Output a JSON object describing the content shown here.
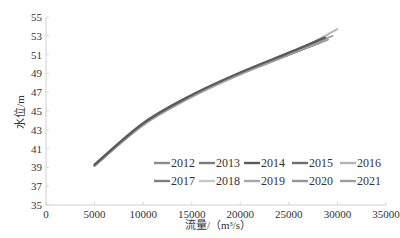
{
  "chart_data": {
    "type": "line",
    "title": "",
    "xlabel": "流量/（m³/s）",
    "ylabel": "水位/m",
    "xlim": [
      0,
      35000
    ],
    "ylim": [
      35,
      55
    ],
    "x_ticks": [
      "0",
      "5000",
      "10000",
      "15000",
      "20000",
      "25000",
      "30000",
      "35000"
    ],
    "y_ticks": [
      "35",
      "37",
      "39",
      "41",
      "43",
      "45",
      "47",
      "49",
      "51",
      "53",
      "55"
    ],
    "grid": false,
    "legend_position": "lower right, inside plot, 2 rows x 5 columns",
    "series": [
      {
        "name": "2012",
        "color": "#8c8c8c",
        "x": [
          5000,
          10000,
          15000,
          20000,
          25000,
          28500
        ],
        "y": [
          39.2,
          43.6,
          46.6,
          49.0,
          51.0,
          52.4
        ]
      },
      {
        "name": "2013",
        "color": "#7a7a7a",
        "x": [
          5000,
          10000,
          15000,
          20000,
          25000,
          28000
        ],
        "y": [
          39.2,
          43.6,
          46.6,
          49.0,
          51.0,
          52.2
        ]
      },
      {
        "name": "2014",
        "color": "#5a5a5a",
        "x": [
          5000,
          10000,
          15000,
          20000,
          25000,
          28700
        ],
        "y": [
          39.3,
          43.7,
          46.7,
          49.1,
          51.2,
          52.8
        ]
      },
      {
        "name": "2015",
        "color": "#6e6e6e",
        "x": [
          5000,
          10000,
          15000,
          20000,
          25000,
          28000
        ],
        "y": [
          39.2,
          43.6,
          46.6,
          49.0,
          51.0,
          52.3
        ]
      },
      {
        "name": "2016",
        "color": "#b4b4b4",
        "x": [
          5000,
          10000,
          15000,
          20000,
          25000,
          30000
        ],
        "y": [
          39.2,
          43.5,
          46.5,
          48.9,
          51.0,
          53.7
        ]
      },
      {
        "name": "2017",
        "color": "#7f7f7f",
        "x": [
          5000,
          10000,
          15000,
          20000,
          25000,
          28000
        ],
        "y": [
          39.2,
          43.6,
          46.6,
          49.0,
          51.0,
          52.2
        ]
      },
      {
        "name": "2018",
        "color": "#c8c8c8",
        "x": [
          5000,
          10000,
          15000,
          20000,
          25000,
          29000
        ],
        "y": [
          39.2,
          43.5,
          46.5,
          48.9,
          51.0,
          52.8
        ]
      },
      {
        "name": "2019",
        "color": "#a8a8a8",
        "x": [
          5000,
          10000,
          15000,
          20000,
          25000,
          29500
        ],
        "y": [
          39.2,
          43.5,
          46.5,
          48.9,
          51.0,
          53.0
        ]
      },
      {
        "name": "2020",
        "color": "#969696",
        "x": [
          5000,
          10000,
          15000,
          20000,
          25000,
          29000
        ],
        "y": [
          39.2,
          43.6,
          46.6,
          49.0,
          51.0,
          52.6
        ]
      },
      {
        "name": "2021",
        "color": "#9e9e9e",
        "x": [
          5000,
          10000,
          15000,
          20000,
          25000,
          29000
        ],
        "y": [
          39.2,
          43.6,
          46.6,
          49.0,
          51.0,
          52.6
        ]
      }
    ]
  },
  "labels": {
    "xlabel": "流量/（m³/s）",
    "ylabel": "水位/m"
  }
}
